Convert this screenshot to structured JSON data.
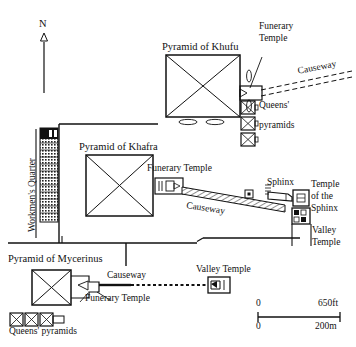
{
  "map": {
    "title": "Giza Pyramid Complex Plan",
    "north_label": "N",
    "labels": {
      "workmens_quarter": "Workmen's Quarter",
      "pyramid_khufu": "Pyramid of Khufu",
      "pyramid_khafra": "Pyramid of Khafra",
      "pyramid_mycerinus": "Pyramid of Mycerinus",
      "funerary_temple_khufu_line1": "Funerary",
      "funerary_temple_khufu_line2": "Temple",
      "funerary_temple_khafra": "Funerary Temple",
      "funerary_temple_mycerinus": "Funerary Temple",
      "queens_pyramids_khufu_line1": "Queens'",
      "queens_pyramids_khufu_line2": "pyramids",
      "queens_pyramids_mycerinus": "Queens' pyramids",
      "causeway_khufu": "Causeway",
      "causeway_khafra": "Causeway",
      "causeway_mycerinus": "Causeway",
      "sphinx": "Sphinx",
      "temple_of_the_sphinx_line1": "Temple",
      "temple_of_the_sphinx_line2": "of the",
      "temple_of_the_sphinx_line3": "Sphinx",
      "valley_temple_khafra_line1": "Valley",
      "valley_temple_khafra_line2": "Temple",
      "valley_temple_mycerinus": "Valley Temple"
    },
    "scale_bar": {
      "ft_min": "0",
      "ft_max": "650ft",
      "m_min": "0",
      "m_max": "200m"
    },
    "colors": {
      "ink": "#111111",
      "paper": "#ffffff",
      "hatch": "#555555"
    }
  }
}
